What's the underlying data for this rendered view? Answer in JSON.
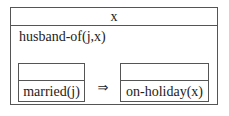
{
  "drs": {
    "universe": "x",
    "conditions": [
      "husband-of(j,x)"
    ],
    "implication": {
      "antecedent": {
        "universe": "",
        "conditions": [
          "married(j)"
        ]
      },
      "operator": "⇒",
      "consequent": {
        "universe": "",
        "conditions": [
          "on-holiday(x)"
        ]
      }
    }
  }
}
